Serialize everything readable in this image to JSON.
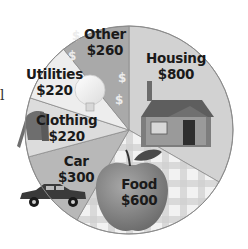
{
  "chart_data": {
    "type": "pie",
    "title": "",
    "total": 2400,
    "start_angle_deg": 0,
    "direction": "clockwise",
    "categories": [
      "Housing",
      "Food",
      "Car",
      "Clothing",
      "Utilities",
      "Other"
    ],
    "values": [
      800,
      600,
      300,
      220,
      220,
      260
    ],
    "value_labels": [
      "$800",
      "$600",
      "$300",
      "$220",
      "$220",
      "$260"
    ],
    "slice_fills": [
      "#d2d2d2",
      "#e6e6e6",
      "#b8b8b8",
      "#dcdcdc",
      "#ededed",
      "#a9a9a9"
    ],
    "legend": "none (labels on slices)"
  },
  "labels": {
    "housing": {
      "name": "Housing",
      "value": "$800"
    },
    "food": {
      "name": "Food",
      "value": "$600"
    },
    "car": {
      "name": "Car",
      "value": "$300"
    },
    "clothing": {
      "name": "Clothing",
      "value": "$220"
    },
    "utilities": {
      "name": "Utilities",
      "value": "$220"
    },
    "other": {
      "name": "Other",
      "value": "$260"
    }
  },
  "stray_text": "l"
}
